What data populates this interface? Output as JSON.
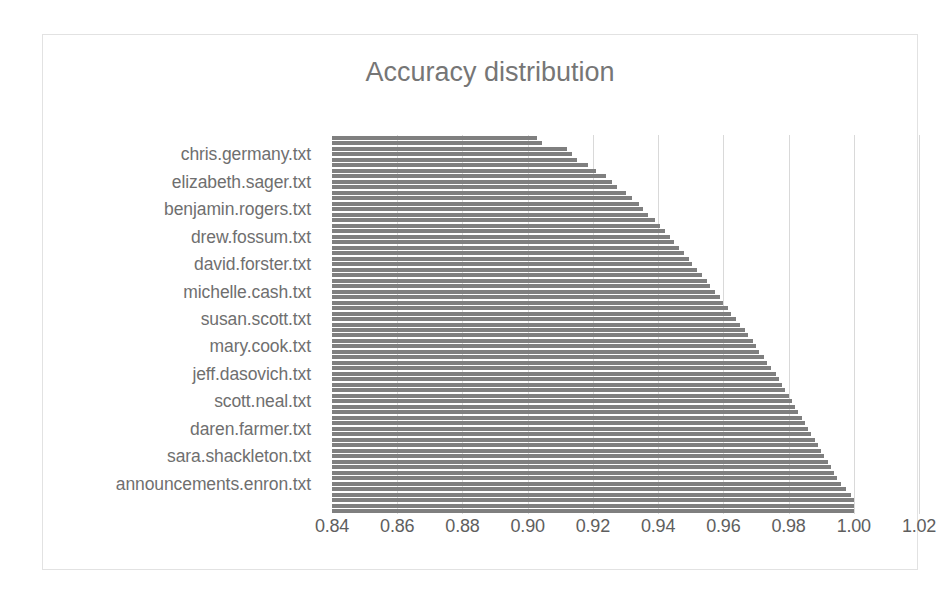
{
  "chart_data": {
    "type": "bar",
    "orientation": "horizontal",
    "title": "Accuracy distribution",
    "xlabel": "",
    "ylabel": "",
    "xlim": [
      0.84,
      1.02
    ],
    "xticks": [
      "0.84",
      "0.86",
      "0.88",
      "0.90",
      "0.92",
      "0.94",
      "0.96",
      "0.98",
      "1.00",
      "1.02"
    ],
    "xtick_values": [
      0.84,
      0.86,
      0.88,
      0.9,
      0.92,
      0.94,
      0.96,
      0.98,
      1.0,
      1.02
    ],
    "grid": "vertical",
    "legend": "none",
    "bar_color": "#7f7f7f",
    "visible_category_labels": [
      "chris.germany.txt",
      "elizabeth.sager.txt",
      "benjamin.rogers.txt",
      "drew.fossum.txt",
      "david.forster.txt",
      "michelle.cash.txt",
      "susan.scott.txt",
      "mary.cook.txt",
      "jeff.dasovich.txt",
      "scott.neal.txt",
      "daren.farmer.txt",
      "sara.shackleton.txt",
      "announcements.enron.txt"
    ],
    "label_every_n_bars": 5,
    "bar_count": 69,
    "values": [
      0.903,
      0.9045,
      0.912,
      0.9135,
      0.915,
      0.9185,
      0.921,
      0.924,
      0.926,
      0.9275,
      0.93,
      0.932,
      0.934,
      0.9355,
      0.937,
      0.939,
      0.9405,
      0.942,
      0.9435,
      0.945,
      0.9465,
      0.948,
      0.9495,
      0.9505,
      0.952,
      0.9535,
      0.955,
      0.956,
      0.9575,
      0.959,
      0.96,
      0.9615,
      0.9625,
      0.964,
      0.965,
      0.9665,
      0.9675,
      0.969,
      0.97,
      0.971,
      0.9725,
      0.9735,
      0.9745,
      0.976,
      0.977,
      0.978,
      0.979,
      0.98,
      0.981,
      0.982,
      0.983,
      0.984,
      0.985,
      0.986,
      0.987,
      0.988,
      0.989,
      0.99,
      0.991,
      0.992,
      0.993,
      0.994,
      0.995,
      0.996,
      0.9975,
      0.999,
      1.0,
      1.0,
      1.0
    ]
  },
  "frame": {
    "border_color": "#e2e2e2"
  }
}
